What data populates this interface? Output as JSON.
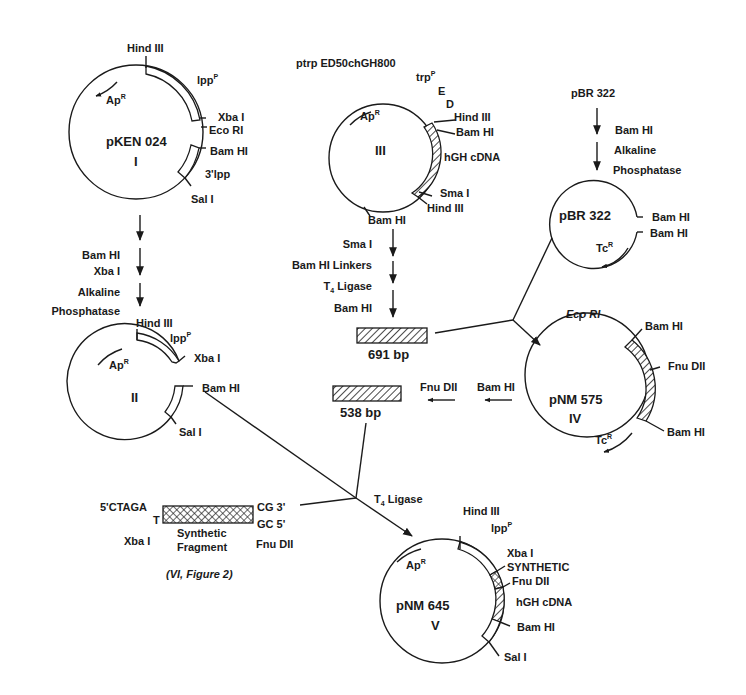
{
  "plasmids": {
    "I": {
      "name": "pKEN 024",
      "numeral": "I",
      "labels": {
        "hind3": "Hind III",
        "lpp": "lpp",
        "lpp_sup": "P",
        "xba1": "Xba I",
        "ecor1": "Eco RI",
        "bamh1": "Bam HI",
        "lpp3": "3'lpp",
        "sal1": "Sal I",
        "ap": "Ap",
        "ap_sup": "R"
      }
    },
    "II": {
      "name": "",
      "numeral": "II",
      "labels": {
        "hind3": "Hind III",
        "lpp": "lpp",
        "lpp_sup": "P",
        "xba1": "Xba I",
        "bamh1": "Bam HI",
        "sal1": "Sal I",
        "ap": "Ap",
        "ap_sup": "R"
      }
    },
    "III": {
      "title": "ptrp ED50chGH800",
      "numeral": "III",
      "labels": {
        "trp": "trp",
        "trp_sup": "P",
        "e": "E",
        "d": "D",
        "hind3a": "Hind III",
        "bamh1a": "Bam HI",
        "hgh": "hGH cDNA",
        "sma1": "Sma I",
        "hind3b": "Hind III",
        "bamh1b": "Bam HI",
        "ap": "Ap",
        "ap_sup": "R"
      }
    },
    "pBR": {
      "title": "pBR 322",
      "name": "pBR 322",
      "labels": {
        "bamh1a": "Bam HI",
        "bamh1b": "Bam HI",
        "tc": "Tc",
        "tc_sup": "R"
      }
    },
    "IV": {
      "name": "pNM 575",
      "numeral": "IV",
      "labels": {
        "ecor1": "Eco RI",
        "bamh1a": "Bam HI",
        "fnu": "Fnu DII",
        "bamh1b": "Bam HI",
        "tc": "Tc",
        "tc_sup": "R"
      }
    },
    "V": {
      "name": "pNM 645",
      "numeral": "V",
      "labels": {
        "hind3": "Hind III",
        "lpp": "lpp",
        "lpp_sup": "P",
        "xba1": "Xba I",
        "synthetic": "SYNTHETIC",
        "fnu": "Fnu DII",
        "hgh": "hGH cDNA",
        "bamh1": "Bam HI",
        "sal1": "Sal I",
        "ap": "Ap",
        "ap_sup": "R"
      }
    }
  },
  "steps": {
    "I_to_II": [
      "Bam HI",
      "Xba I",
      "Alkaline",
      "Phosphatase"
    ],
    "III_to_691": [
      "Sma I",
      "Bam HI Linkers",
      "T",
      "Ligase",
      "Bam HI"
    ],
    "t4_sub": "4",
    "pBR_cut": [
      "Bam HI",
      "Alkaline",
      "Phosphatase"
    ],
    "IV_to_538": [
      "Fnu DII",
      "Bam HI"
    ],
    "ligation": "T",
    "ligation_rest": "Ligase"
  },
  "fragments": {
    "f691": "691 bp",
    "f538": "538 bp",
    "synthetic": {
      "left_top": "5'CTAGA",
      "left_bottom": "T",
      "right_top": "CG 3'",
      "right_bottom": "GC 5'",
      "left_enzyme": "Xba I",
      "name_line1": "Synthetic",
      "name_line2": "Fragment",
      "right_enzyme": "Fnu DII",
      "caption": "(VI, Figure 2)"
    }
  }
}
